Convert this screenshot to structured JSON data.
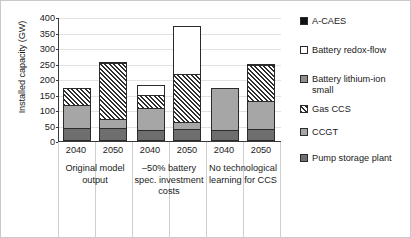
{
  "chart_data": {
    "type": "bar",
    "stacked": true,
    "title": "",
    "xlabel": "",
    "ylabel": "Installed capacity (GW)",
    "ylim": [
      0,
      400
    ],
    "ytick_values": [
      0,
      50,
      100,
      150,
      200,
      250,
      300,
      350,
      400
    ],
    "ytick_labels": [
      "0",
      "50",
      "100",
      "150",
      "200",
      "250",
      "300",
      "350",
      "400"
    ],
    "grid": true,
    "legend_position": "right",
    "categories": [
      "2040",
      "2050",
      "2040",
      "2050",
      "2040",
      "2050"
    ],
    "groups": [
      {
        "label": "Original model output",
        "categories": [
          "2040",
          "2050"
        ]
      },
      {
        "label": "–50% battery spec. investment costs",
        "categories": [
          "2040",
          "2050"
        ]
      },
      {
        "label": "No technological learning for CCS",
        "categories": [
          "2040",
          "2050"
        ]
      }
    ],
    "series": [
      {
        "name": "Pump storage plant",
        "color": "#6e6e6e",
        "values": [
          42,
          42,
          35,
          40,
          35,
          40
        ]
      },
      {
        "name": "CCGT",
        "color": "#a6a6a6",
        "values": [
          73,
          28,
          70,
          20,
          137,
          90
        ]
      },
      {
        "name": "Gas CCS",
        "color": "hatched",
        "values": [
          57,
          183,
          45,
          155,
          0,
          115
        ]
      },
      {
        "name": "Battery lithium-ion small",
        "color": "#8f8f8f",
        "values": [
          0,
          2,
          0,
          0,
          0,
          5
        ]
      },
      {
        "name": "Battery redox-flow",
        "color": "#ffffff",
        "values": [
          0,
          0,
          30,
          155,
          0,
          0
        ]
      },
      {
        "name": "A-CAES",
        "color": "#111111",
        "values": [
          0,
          0,
          0,
          0,
          0,
          0
        ]
      }
    ],
    "bar_totals": [
      172,
      255,
      180,
      370,
      172,
      250
    ],
    "legend_entries": [
      "A-CAES",
      "Battery redox-flow",
      "Battery lithium-ion\nsmall",
      "Gas CCS",
      "CCGT",
      "Pump storage plant"
    ]
  }
}
